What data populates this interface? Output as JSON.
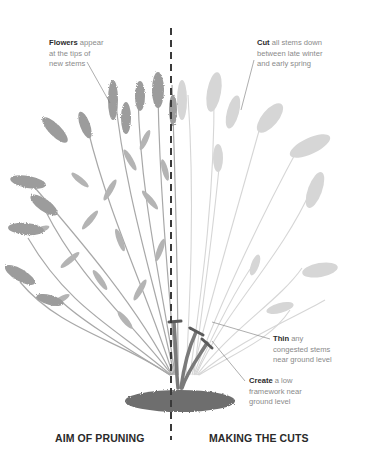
{
  "diagram": {
    "type": "pruning-illustration"
  },
  "annotations": {
    "flowers": {
      "bold": "Flowers",
      "rest_line1": " appear",
      "line2": "at the tips of",
      "line3": "new stems"
    },
    "cut": {
      "bold": "Cut",
      "rest_line1": " all stems down",
      "line2": "between late winter",
      "line3": "and early spring"
    },
    "thin": {
      "bold": "Thin",
      "rest_line1": " any",
      "line2": "congested stems",
      "line3": "near ground level"
    },
    "create": {
      "bold": "Create",
      "rest_line1": " a low",
      "line2": "framework near",
      "line3": "ground level"
    }
  },
  "captions": {
    "left": "AIM OF PRUNING",
    "right": "MAKING THE CUTS"
  },
  "colors": {
    "divider": "#3a3a3a",
    "full_plant": "#9a9a9a",
    "ghost_plant": "#d4d4d4",
    "soil": "#6e6e6e",
    "cut_mark": "#5a5a5a"
  }
}
